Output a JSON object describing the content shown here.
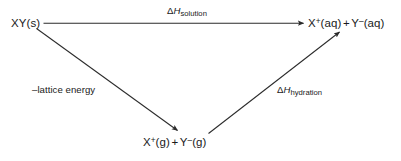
{
  "diagram": {
    "type": "energy-cycle",
    "stroke_color": "#2b2b2b",
    "text_color": "#1a1a1a",
    "background_color": "#ffffff",
    "nodes": [
      {
        "id": "reactant",
        "name": "solid-ionic-compound",
        "text": "XY(s)",
        "parts": [
          {
            "text": "XY(s)",
            "style": "normal"
          }
        ]
      },
      {
        "id": "products",
        "name": "aqueous-ions",
        "text": "X+(aq) + Y-(aq)",
        "parts": [
          {
            "text": "X",
            "style": "normal"
          },
          {
            "text": "+",
            "style": "superscript"
          },
          {
            "text": "(aq)",
            "style": "normal"
          },
          {
            "text": "+",
            "style": "operator"
          },
          {
            "text": "Y",
            "style": "normal"
          },
          {
            "text": "–",
            "style": "superscript"
          },
          {
            "text": "(aq)",
            "style": "normal"
          }
        ]
      },
      {
        "id": "gasions",
        "name": "gaseous-ions",
        "text": "X+(g) + Y-(g)",
        "parts": [
          {
            "text": "X",
            "style": "normal"
          },
          {
            "text": "+",
            "style": "superscript"
          },
          {
            "text": "(g)",
            "style": "normal"
          },
          {
            "text": "+",
            "style": "operator"
          },
          {
            "text": "Y",
            "style": "normal"
          },
          {
            "text": "–",
            "style": "superscript"
          },
          {
            "text": "(g)",
            "style": "normal"
          }
        ]
      }
    ],
    "arrows": [
      {
        "id": "solution",
        "name": "arrow-solution",
        "from": "reactant",
        "to": "products",
        "label_delta": "Δ",
        "label_symbol": "H",
        "label_subscript": "solution",
        "label_text": "ΔHsolution"
      },
      {
        "id": "lattice",
        "name": "arrow-lattice-energy",
        "from": "reactant",
        "to": "gasions",
        "label_text": "–lattice energy"
      },
      {
        "id": "hydration",
        "name": "arrow-hydration",
        "from": "gasions",
        "to": "products",
        "label_delta": "Δ",
        "label_symbol": "H",
        "label_subscript": "hydration",
        "label_text": "ΔHhydration"
      }
    ]
  },
  "caption": {
    "sliver_text": ""
  }
}
